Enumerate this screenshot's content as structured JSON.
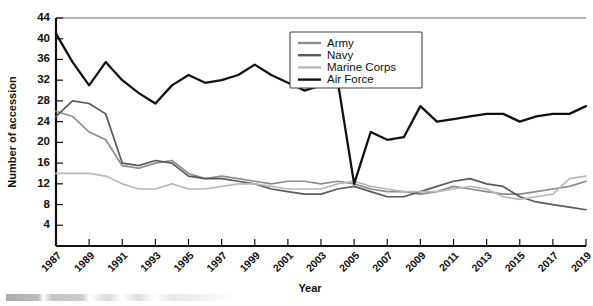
{
  "chart_data": {
    "type": "line",
    "title": "",
    "xlabel": "Year",
    "ylabel": "Number of accession",
    "xlim": [
      1987,
      2019
    ],
    "ylim": [
      0,
      44
    ],
    "yticks": [
      4,
      8,
      12,
      16,
      20,
      24,
      28,
      32,
      36,
      40,
      44
    ],
    "grid": false,
    "legend_position": "top-right",
    "x": [
      1987,
      1988,
      1989,
      1990,
      1991,
      1992,
      1993,
      1994,
      1995,
      1996,
      1997,
      1998,
      1999,
      2000,
      2001,
      2002,
      2003,
      2004,
      2005,
      2006,
      2007,
      2008,
      2009,
      2010,
      2011,
      2012,
      2013,
      2014,
      2015,
      2016,
      2017,
      2018,
      2019
    ],
    "xtick_labels": [
      "1987",
      "1989",
      "1991",
      "1993",
      "1995",
      "1997",
      "1999",
      "2001",
      "2003",
      "2005",
      "2007",
      "2009",
      "2011",
      "2013",
      "2015",
      "2017",
      "2019"
    ],
    "series": [
      {
        "name": "Army",
        "color": "#8c8c8c",
        "values": [
          26.0,
          25.0,
          22.0,
          20.5,
          15.5,
          15.0,
          16.0,
          16.5,
          14.0,
          13.0,
          13.5,
          13.0,
          12.5,
          12.0,
          12.5,
          12.5,
          12.0,
          12.5,
          12.0,
          11.0,
          10.5,
          10.5,
          10.0,
          10.5,
          11.5,
          11.0,
          10.5,
          10.0,
          10.0,
          10.5,
          11.0,
          11.5,
          12.5
        ]
      },
      {
        "name": "Navy",
        "color": "#5a5a5a",
        "values": [
          25.0,
          28.0,
          27.5,
          25.5,
          16.0,
          15.5,
          16.5,
          16.0,
          13.5,
          13.0,
          13.0,
          12.5,
          12.0,
          11.0,
          10.5,
          10.0,
          10.0,
          11.0,
          11.5,
          10.5,
          9.5,
          9.5,
          10.5,
          11.5,
          12.5,
          13.0,
          12.0,
          11.5,
          9.5,
          8.5,
          8.0,
          7.5,
          7.0
        ]
      },
      {
        "name": "Marine Corps",
        "color": "#b8b8b8",
        "values": [
          14.0,
          14.0,
          14.0,
          13.5,
          12.0,
          11.0,
          11.0,
          12.0,
          11.0,
          11.0,
          11.5,
          12.0,
          12.0,
          11.5,
          11.0,
          11.0,
          11.0,
          12.0,
          12.5,
          11.5,
          11.0,
          10.5,
          10.5,
          10.5,
          11.0,
          11.5,
          11.0,
          9.5,
          9.0,
          9.5,
          10.0,
          13.0,
          13.5
        ]
      },
      {
        "name": "Air Force",
        "color": "#111111",
        "values": [
          41.0,
          35.5,
          31.0,
          35.5,
          32.0,
          29.5,
          27.5,
          31.0,
          33.0,
          31.5,
          32.0,
          33.0,
          35.0,
          33.0,
          31.5,
          30.0,
          31.0,
          32.0,
          12.0,
          22.0,
          20.5,
          21.0,
          27.0,
          24.0,
          24.5,
          25.0,
          25.5,
          25.5,
          24.0,
          25.0,
          25.5,
          25.5,
          27.0
        ]
      }
    ]
  },
  "legend": {
    "entries": [
      {
        "label": "Army"
      },
      {
        "label": "Navy"
      },
      {
        "label": "Marine Corps"
      },
      {
        "label": "Air Force"
      }
    ]
  }
}
